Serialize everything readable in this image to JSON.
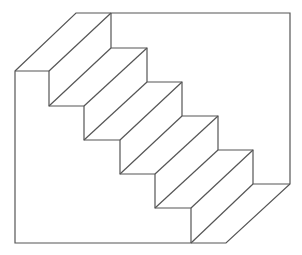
{
  "figure": {
    "stroke_color": "#555555",
    "background": "#ffffff",
    "offset": [
      62,
      -58
    ],
    "outline": [
      [
        15,
        71
      ],
      [
        76,
        13
      ],
      [
        290,
        13
      ],
      [
        290,
        184
      ],
      [
        226,
        243
      ],
      [
        15,
        243
      ]
    ],
    "front_profile": [
      [
        15,
        71
      ],
      [
        49,
        71
      ],
      [
        49,
        106
      ],
      [
        84,
        106
      ],
      [
        84,
        140
      ],
      [
        120,
        140
      ],
      [
        120,
        174
      ],
      [
        155,
        174
      ],
      [
        155,
        208
      ],
      [
        191,
        208
      ],
      [
        191,
        243
      ]
    ],
    "back_profile": [
      [
        111,
        13
      ],
      [
        111,
        48
      ],
      [
        147,
        48
      ],
      [
        147,
        82
      ],
      [
        182,
        82
      ],
      [
        182,
        116
      ],
      [
        218,
        116
      ],
      [
        218,
        150
      ],
      [
        253,
        150
      ],
      [
        253,
        184
      ],
      [
        290,
        184
      ]
    ],
    "connectors": [
      [
        [
          49,
          71
        ],
        [
          111,
          13
        ]
      ],
      [
        [
          49,
          106
        ],
        [
          111,
          48
        ]
      ],
      [
        [
          84,
          106
        ],
        [
          147,
          48
        ]
      ],
      [
        [
          84,
          140
        ],
        [
          147,
          82
        ]
      ],
      [
        [
          120,
          140
        ],
        [
          182,
          82
        ]
      ],
      [
        [
          120,
          174
        ],
        [
          182,
          116
        ]
      ],
      [
        [
          155,
          174
        ],
        [
          218,
          116
        ]
      ],
      [
        [
          155,
          208
        ],
        [
          218,
          150
        ]
      ],
      [
        [
          191,
          208
        ],
        [
          253,
          150
        ]
      ],
      [
        [
          191,
          243
        ],
        [
          253,
          184
        ]
      ]
    ]
  }
}
